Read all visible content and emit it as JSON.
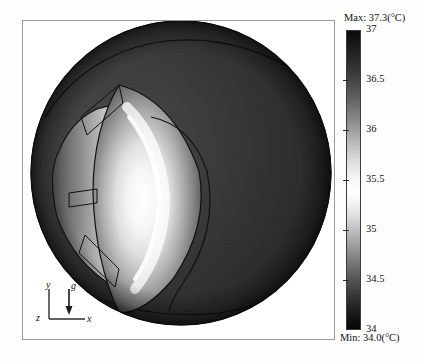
{
  "figure": {
    "type": "3d-contour-surface",
    "background": "#ffffff",
    "frame_border_color": "#9a9a9a"
  },
  "axis_triad": {
    "name": "coordinate-axis-indicator",
    "y_label": "y",
    "x_label": "x",
    "z_label": "z",
    "gravity_label": "g",
    "gravity_direction": "down"
  },
  "colorbar": {
    "name": "temperature-colorbar",
    "colormap": "grayscale-diverging",
    "unit": "(°C)",
    "max_label": "Max: 37.3(°C)",
    "min_label": "Min: 34.0(°C)",
    "max_value": 37.3,
    "min_value": 34.0,
    "ticks": [
      {
        "label": "37",
        "value": 37.0
      },
      {
        "label": "36.5",
        "value": 36.5
      },
      {
        "label": "36",
        "value": 36.0
      },
      {
        "label": "35.5",
        "value": 35.5
      },
      {
        "label": "35",
        "value": 35.0
      },
      {
        "label": "34.5",
        "value": 34.5
      },
      {
        "label": "34",
        "value": 34.0
      }
    ]
  },
  "chart_data": {
    "type": "heatmap",
    "title": "",
    "xlabel": "x",
    "ylabel": "y",
    "colorbar_label": "(°C)",
    "zlim": [
      34.0,
      37.3
    ],
    "legend_position": "right",
    "grid": false,
    "annotations": [
      "Max: 37.3(°C)",
      "Min: 34.0(°C)"
    ],
    "tick_labels": [
      "37",
      "36.5",
      "36",
      "35.5",
      "35",
      "34.5",
      "34"
    ],
    "tick_values": [
      37.0,
      36.5,
      36.0,
      35.5,
      35.0,
      34.5,
      34.0
    ],
    "regions": [
      {
        "name": "sclera-posterior",
        "temperature": 37.1
      },
      {
        "name": "sclera-mid",
        "temperature": 36.9
      },
      {
        "name": "limbus",
        "temperature": 35.8
      },
      {
        "name": "cornea-periphery",
        "temperature": 35.2
      },
      {
        "name": "cornea-center",
        "temperature": 34.3
      }
    ]
  }
}
